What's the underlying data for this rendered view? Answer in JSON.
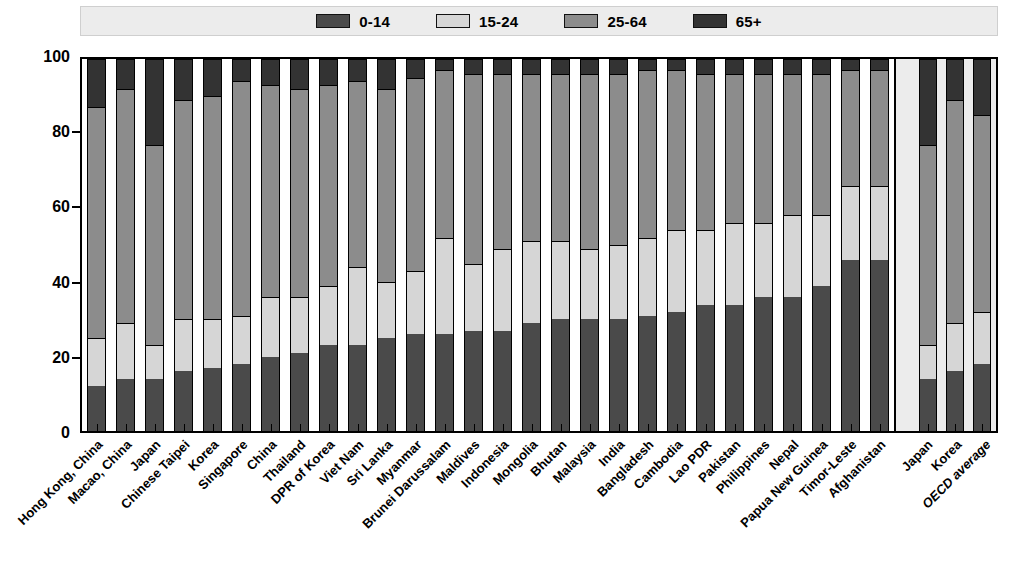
{
  "chart_data": {
    "type": "bar",
    "subtype": "stacked-percentage-column",
    "title": "",
    "xlabel": "",
    "ylabel": "",
    "ylim": [
      0,
      100
    ],
    "yticks": [
      0,
      20,
      40,
      60,
      80,
      100
    ],
    "grid": false,
    "legend_position": "top-center",
    "stack_total": 100,
    "series": [
      {
        "name": "0-14",
        "color": "#4a4a4a",
        "values": [
          12,
          14,
          14,
          16,
          17,
          18,
          20,
          21,
          23,
          23,
          25,
          26,
          26,
          27,
          27,
          29,
          30,
          30,
          30,
          31,
          32,
          34,
          34,
          36,
          36,
          39,
          46,
          46
        ]
      },
      {
        "name": "15-24",
        "color": "#d6d6d6",
        "values": [
          13,
          15,
          9,
          14,
          13,
          13,
          16,
          15,
          16,
          21,
          15,
          17,
          26,
          18,
          22,
          22,
          21,
          19,
          20,
          21,
          22,
          20,
          22,
          20,
          22,
          19,
          20,
          20
        ]
      },
      {
        "name": "25-64",
        "color": "#8c8c8c",
        "values": [
          62,
          63,
          54,
          59,
          60,
          63,
          57,
          56,
          54,
          50,
          52,
          52,
          45,
          51,
          47,
          45,
          45,
          47,
          46,
          45,
          43,
          42,
          40,
          40,
          38,
          38,
          31,
          31
        ]
      },
      {
        "name": "65+",
        "color": "#333333",
        "values": [
          13,
          8,
          23,
          11,
          10,
          6,
          7,
          8,
          7,
          6,
          8,
          5,
          3,
          4,
          4,
          4,
          4,
          4,
          4,
          3,
          3,
          4,
          4,
          4,
          4,
          4,
          3,
          3
        ]
      }
    ],
    "categories": [
      "Hong Kong, China",
      "Macao, China",
      "Japan",
      "Chinese Taipei",
      "Korea",
      "Singapore",
      "China",
      "Thailand",
      "DPR of Korea",
      "Viet Nam",
      "Sri Lanka",
      "Myanmar",
      "Brunei Darussalam",
      "Maldives",
      "Indonesia",
      "Mongolia",
      "Bhutan",
      "Malaysia",
      "India",
      "Bangladesh",
      "Cambodia",
      "Lao PDR",
      "Pakistan",
      "Philippines",
      "Nepal",
      "Papua New Guinea",
      "Timor-Leste",
      "Afghanistan"
    ],
    "groups": [
      {
        "name": "asia-pacific",
        "highlighted": false,
        "background": "#ffffff",
        "categories": [
          "Hong Kong, China",
          "Macao, China",
          "Japan",
          "Chinese Taipei",
          "Korea",
          "Singapore",
          "China",
          "Thailand",
          "DPR of Korea",
          "Viet Nam",
          "Sri Lanka",
          "Myanmar",
          "Brunei Darussalam",
          "Maldives",
          "Indonesia",
          "Mongolia",
          "Bhutan",
          "Malaysia",
          "India",
          "Bangladesh",
          "Cambodia",
          "Lao PDR",
          "Pakistan",
          "Philippines",
          "Nepal",
          "Papua New Guinea",
          "Timor-Leste",
          "Afghanistan"
        ],
        "bars": [
          {
            "label": "Hong Kong, China",
            "0-14": 12,
            "15-24": 13,
            "25-64": 62,
            "65+": 13
          },
          {
            "label": "Macao, China",
            "0-14": 14,
            "15-24": 15,
            "25-64": 63,
            "65+": 8
          },
          {
            "label": "Japan",
            "0-14": 14,
            "15-24": 9,
            "25-64": 54,
            "65+": 23
          },
          {
            "label": "Chinese Taipei",
            "0-14": 16,
            "15-24": 14,
            "25-64": 59,
            "65+": 11
          },
          {
            "label": "Korea",
            "0-14": 17,
            "15-24": 13,
            "25-64": 60,
            "65+": 10
          },
          {
            "label": "Singapore",
            "0-14": 18,
            "15-24": 13,
            "25-64": 63,
            "65+": 6
          },
          {
            "label": "China",
            "0-14": 20,
            "15-24": 16,
            "25-64": 57,
            "65+": 7
          },
          {
            "label": "Thailand",
            "0-14": 21,
            "15-24": 15,
            "25-64": 56,
            "65+": 8
          },
          {
            "label": "DPR of Korea",
            "0-14": 23,
            "15-24": 16,
            "25-64": 54,
            "65+": 7
          },
          {
            "label": "Viet Nam",
            "0-14": 23,
            "15-24": 21,
            "25-64": 50,
            "65+": 6
          },
          {
            "label": "Sri Lanka",
            "0-14": 25,
            "15-24": 15,
            "25-64": 52,
            "65+": 8
          },
          {
            "label": "Myanmar",
            "0-14": 26,
            "15-24": 17,
            "25-64": 52,
            "65+": 5
          },
          {
            "label": "Brunei Darussalam",
            "0-14": 26,
            "15-24": 26,
            "25-64": 45,
            "65+": 3
          },
          {
            "label": "Maldives",
            "0-14": 27,
            "15-24": 18,
            "25-64": 51,
            "65+": 4
          },
          {
            "label": "Indonesia",
            "0-14": 27,
            "15-24": 22,
            "25-64": 47,
            "65+": 4
          },
          {
            "label": "Mongolia",
            "0-14": 29,
            "15-24": 22,
            "25-64": 45,
            "65+": 4
          },
          {
            "label": "Bhutan",
            "0-14": 30,
            "15-24": 21,
            "25-64": 45,
            "65+": 4
          },
          {
            "label": "Malaysia",
            "0-14": 30,
            "15-24": 19,
            "25-64": 47,
            "65+": 4
          },
          {
            "label": "India",
            "0-14": 30,
            "15-24": 20,
            "25-64": 46,
            "65+": 4
          },
          {
            "label": "Bangladesh",
            "0-14": 31,
            "15-24": 21,
            "25-64": 45,
            "65+": 3
          },
          {
            "label": "Cambodia",
            "0-14": 32,
            "15-24": 22,
            "25-64": 43,
            "65+": 3
          },
          {
            "label": "Lao PDR",
            "0-14": 34,
            "15-24": 20,
            "25-64": 42,
            "65+": 4
          },
          {
            "label": "Pakistan",
            "0-14": 34,
            "15-24": 22,
            "25-64": 40,
            "65+": 4
          },
          {
            "label": "Philippines",
            "0-14": 36,
            "15-24": 20,
            "25-64": 40,
            "65+": 4
          },
          {
            "label": "Nepal",
            "0-14": 36,
            "15-24": 22,
            "25-64": 38,
            "65+": 4
          },
          {
            "label": "Papua New Guinea",
            "0-14": 39,
            "15-24": 19,
            "25-64": 38,
            "65+": 4
          },
          {
            "label": "Timor-Leste",
            "0-14": 46,
            "15-24": 20,
            "25-64": 31,
            "65+": 3
          },
          {
            "label": "Afghanistan",
            "0-14": 46,
            "15-24": 20,
            "25-64": 31,
            "65+": 3
          }
        ]
      },
      {
        "name": "oecd-reference",
        "highlighted": true,
        "background": "#ececec",
        "categories": [
          "Japan",
          "Korea",
          "OECD average"
        ],
        "bars": [
          {
            "label": "Japan",
            "0-14": 14,
            "15-24": 9,
            "25-64": 54,
            "65+": 23
          },
          {
            "label": "Korea",
            "0-14": 16,
            "15-24": 13,
            "25-64": 60,
            "65+": 11
          },
          {
            "label": "OECD average",
            "0-14": 18,
            "15-24": 14,
            "25-64": 53,
            "65+": 15
          }
        ]
      }
    ]
  },
  "legend": {
    "items": [
      {
        "label": "0-14",
        "color": "#4a4a4a"
      },
      {
        "label": "15-24",
        "color": "#d6d6d6"
      },
      {
        "label": "25-64",
        "color": "#8c8c8c"
      },
      {
        "label": "65+",
        "color": "#333333"
      }
    ]
  },
  "axis": {
    "y": {
      "ticks": [
        "100",
        "80",
        "60",
        "40",
        "20",
        "0"
      ],
      "values": [
        100,
        80,
        60,
        40,
        20,
        0
      ]
    }
  }
}
